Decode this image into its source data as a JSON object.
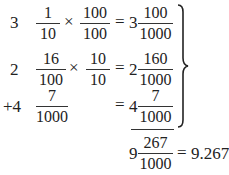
{
  "rows": [
    {
      "whole": "3",
      "frac_a": {
        "num": "1",
        "den": "10"
      },
      "times": "×",
      "frac_b": {
        "num": "100",
        "den": "100"
      },
      "equals": "=",
      "result_whole": "3",
      "result_frac": {
        "num": "100",
        "den": "1000"
      }
    },
    {
      "whole": "2",
      "frac_a": {
        "num": "16",
        "den": "100"
      },
      "times": "×",
      "frac_b": {
        "num": "10",
        "den": "10"
      },
      "equals": "=",
      "result_whole": "2",
      "result_frac": {
        "num": "160",
        "den": "1000"
      }
    },
    {
      "whole": "+4",
      "frac_a": {
        "num": "7",
        "den": "1000"
      },
      "equals": "=",
      "result_whole": "4",
      "result_frac": {
        "num": "7",
        "den": "1000"
      }
    }
  ],
  "brace": "}",
  "total": {
    "whole": "9",
    "frac": {
      "num": "267",
      "den": "1000"
    },
    "equals": "=",
    "decimal": "9.267"
  }
}
